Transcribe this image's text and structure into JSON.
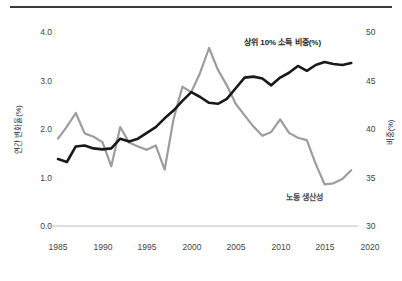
{
  "chart_data": {
    "type": "line",
    "title": "",
    "subtitle": "",
    "xlabel": "",
    "ylabel": "연간 변화율(%)",
    "ylabel_right": "비중(%)",
    "xlim": [
      1984,
      2020
    ],
    "ylim": [
      0.0,
      4.0
    ],
    "ylim_right": [
      30,
      50
    ],
    "grid": false,
    "legend_position": "inline-annotation",
    "xticks": [
      1985,
      1990,
      1995,
      2000,
      2005,
      2010,
      2015,
      2020
    ],
    "xtick_labels": [
      "1985",
      "1990",
      "1995",
      "2000",
      "2005",
      "2010",
      "2015",
      "2020"
    ],
    "yticks": [
      0.0,
      1.0,
      2.0,
      3.0,
      4.0
    ],
    "ytick_labels": [
      "0.0",
      "1.0",
      "2.0",
      "3.0",
      "4.0"
    ],
    "yticks_right": [
      30,
      35,
      40,
      45,
      50
    ],
    "ytick_labels_right": [
      "30",
      "35",
      "40",
      "45",
      "50"
    ],
    "annotations": [
      {
        "text": "상위 10% 소득 비중(%)",
        "series": "top10_income_share",
        "color": "#1c1c1c"
      },
      {
        "text": "노동 생산성",
        "series": "labor_productivity",
        "color": "#4a4a4a"
      }
    ],
    "series": [
      {
        "name": "상위 10% 소득 비중(%)",
        "axis": "right",
        "color": "#191919",
        "x": [
          1985,
          1986,
          1987,
          1988,
          1989,
          1990,
          1991,
          1992,
          1993,
          1994,
          1995,
          1996,
          1997,
          1998,
          1999,
          2000,
          2001,
          2002,
          2003,
          2004,
          2005,
          2006,
          2007,
          2008,
          2009,
          2010,
          2011,
          2012,
          2013,
          2014,
          2015,
          2016,
          2017,
          2018
        ],
        "values": [
          36.9,
          36.6,
          38.2,
          38.3,
          38.0,
          37.9,
          38.0,
          39.0,
          38.7,
          39.0,
          39.6,
          40.2,
          41.1,
          41.9,
          42.9,
          43.8,
          43.3,
          42.7,
          42.6,
          43.1,
          44.2,
          45.3,
          45.4,
          45.2,
          44.5,
          45.3,
          45.8,
          46.5,
          46.0,
          46.6,
          46.9,
          46.7,
          46.6,
          46.8
        ],
        "left_axis_equivalent": [
          1.38,
          1.32,
          1.64,
          1.66,
          1.6,
          1.58,
          1.6,
          1.8,
          1.74,
          1.8,
          1.92,
          2.04,
          2.22,
          2.38,
          2.58,
          2.76,
          2.66,
          2.54,
          2.52,
          2.62,
          2.84,
          3.06,
          3.08,
          3.04,
          2.9,
          3.06,
          3.16,
          3.3,
          3.2,
          3.32,
          3.38,
          3.34,
          3.32,
          3.36
        ]
      },
      {
        "name": "노동 생산성",
        "axis": "left",
        "color": "#9d9d9d",
        "x": [
          1985,
          1986,
          1987,
          1988,
          1989,
          1990,
          1991,
          1992,
          1993,
          1994,
          1995,
          1996,
          1997,
          1998,
          1999,
          2000,
          2001,
          2002,
          2003,
          2004,
          2005,
          2006,
          2007,
          2008,
          2009,
          2010,
          2011,
          2012,
          2013,
          2014,
          2015,
          2016,
          2017,
          2018
        ],
        "values": [
          1.8,
          2.05,
          2.33,
          1.91,
          1.84,
          1.73,
          1.23,
          2.04,
          1.72,
          1.64,
          1.57,
          1.66,
          1.16,
          2.2,
          2.87,
          2.76,
          3.16,
          3.67,
          3.22,
          2.9,
          2.52,
          2.28,
          2.05,
          1.86,
          1.94,
          2.2,
          1.92,
          1.82,
          1.77,
          1.28,
          0.86,
          0.88,
          0.97,
          1.15
        ],
        "right_axis_equivalent": [
          39.0,
          40.3,
          41.7,
          39.6,
          39.2,
          38.7,
          36.2,
          40.2,
          38.6,
          38.2,
          37.9,
          38.3,
          35.8,
          41.0,
          44.4,
          43.8,
          45.8,
          48.4,
          46.1,
          44.5,
          42.6,
          41.4,
          40.3,
          39.3,
          39.7,
          41.0,
          39.6,
          39.1,
          38.9,
          36.4,
          34.3,
          34.4,
          34.9,
          35.8
        ]
      }
    ]
  },
  "axes": {
    "left": {
      "label": "연간 변화율(%)",
      "ticks": [
        "4.0",
        "3.0",
        "2.0",
        "1.0",
        "0.0"
      ]
    },
    "right": {
      "label": "비중(%)",
      "ticks": [
        "50",
        "45",
        "40",
        "35",
        "30"
      ]
    },
    "x": {
      "ticks": [
        "1985",
        "1990",
        "1995",
        "2000",
        "2005",
        "2010",
        "2015",
        "2020"
      ]
    }
  },
  "labels": {
    "black_series": "상위 10% 소득 비중(%)",
    "gray_series": "노동 생산성"
  },
  "colors": {
    "black_line": "#191919",
    "gray_line": "#9d9d9d",
    "rule": "#3a3a3a",
    "baseline": "#bdbdbd",
    "text": "#444444"
  }
}
